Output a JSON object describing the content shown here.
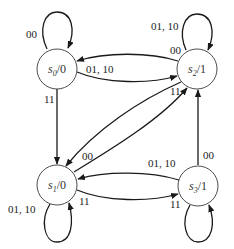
{
  "diagram": {
    "type": "finite-state-machine",
    "states": [
      {
        "id": "s0",
        "name": "s",
        "sub": "0",
        "output": "/0"
      },
      {
        "id": "s1",
        "name": "s",
        "sub": "1",
        "output": "/0"
      },
      {
        "id": "s2",
        "name": "s",
        "sub": "2",
        "output": "/1"
      },
      {
        "id": "s3",
        "name": "s",
        "sub": "3",
        "output": "/1"
      }
    ],
    "transitions": [
      {
        "from": "s0",
        "to": "s0",
        "label": "00"
      },
      {
        "from": "s0",
        "to": "s2",
        "label": "01, 10"
      },
      {
        "from": "s2",
        "to": "s0",
        "label": "00"
      },
      {
        "from": "s0",
        "to": "s1",
        "label": "11"
      },
      {
        "from": "s2",
        "to": "s2",
        "label": "01, 10"
      },
      {
        "from": "s2",
        "to": "s1",
        "label": "11"
      },
      {
        "from": "s1",
        "to": "s2",
        "label": "00"
      },
      {
        "from": "s1",
        "to": "s1",
        "label": "01, 10"
      },
      {
        "from": "s1",
        "to": "s3",
        "label": "11"
      },
      {
        "from": "s3",
        "to": "s1",
        "label": "01, 10"
      },
      {
        "from": "s3",
        "to": "s2",
        "label": "00"
      },
      {
        "from": "s3",
        "to": "s3",
        "label": "11"
      }
    ],
    "labels": {
      "s0_self": "00",
      "s0_s2_pair": "01, 10",
      "s2_s0_in": "00",
      "s0_s1": "11",
      "s2_self": "01, 10",
      "s2_diag": "11",
      "s1_diag": "00",
      "s1_self": "01, 10",
      "s1_s3": "11",
      "s3_s1": "01, 10",
      "s3_s2": "00",
      "s3_self": "11"
    }
  }
}
